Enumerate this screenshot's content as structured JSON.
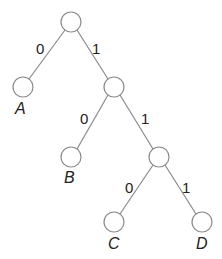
{
  "diagram": {
    "type": "binary-tree",
    "nodes": [
      {
        "id": "root",
        "label": ""
      },
      {
        "id": "A",
        "label": "A"
      },
      {
        "id": "n2",
        "label": ""
      },
      {
        "id": "B",
        "label": "B"
      },
      {
        "id": "n3",
        "label": ""
      },
      {
        "id": "C",
        "label": "C"
      },
      {
        "id": "D",
        "label": "D"
      }
    ],
    "edges": [
      {
        "from": "root",
        "to": "A",
        "label": "0"
      },
      {
        "from": "root",
        "to": "n2",
        "label": "1"
      },
      {
        "from": "n2",
        "to": "B",
        "label": "0"
      },
      {
        "from": "n2",
        "to": "n3",
        "label": "1"
      },
      {
        "from": "n3",
        "to": "C",
        "label": "0"
      },
      {
        "from": "n3",
        "to": "D",
        "label": "1"
      }
    ]
  }
}
